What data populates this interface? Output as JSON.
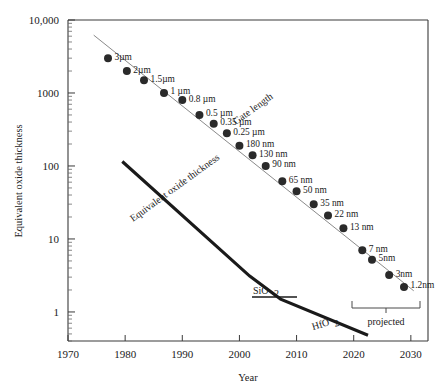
{
  "chart_data": {
    "type": "scatter",
    "title": "",
    "xlabel": "Year",
    "ylabel": "Equivalent oxide thickness",
    "xlim": [
      1970,
      2033
    ],
    "ylim": [
      0.4,
      10000
    ],
    "yscale": "log",
    "xscale": "linear",
    "grid": false,
    "legend": "none",
    "xticks": [
      1970,
      1980,
      1990,
      2000,
      2010,
      2020,
      2030
    ],
    "xticklabels": [
      "1970",
      "1980",
      "1990",
      "2000",
      "2010",
      "2020",
      "2030"
    ],
    "yticks": [
      1,
      10,
      100,
      1000,
      10000
    ],
    "yticklabels": [
      "1",
      "10",
      "100",
      "1000",
      "10,000"
    ],
    "series": [
      {
        "name": "Gate length",
        "type": "scatter",
        "annotation": "Gate length",
        "points": [
          {
            "label": "3µm",
            "x": 1977.0,
            "y": 3000
          },
          {
            "label": "2µm",
            "x": 1980.3,
            "y": 2000
          },
          {
            "label": "1.5µm",
            "x": 1983.3,
            "y": 1500
          },
          {
            "label": "1 µm",
            "x": 1986.8,
            "y": 1000
          },
          {
            "label": "0.8 µm",
            "x": 1990.0,
            "y": 800
          },
          {
            "label": "0.5 µm",
            "x": 1993.0,
            "y": 500
          },
          {
            "label": "0.35 µm",
            "x": 1995.5,
            "y": 380
          },
          {
            "label": "0.25 µm",
            "x": 1997.8,
            "y": 280
          },
          {
            "label": "180 nm",
            "x": 2000.0,
            "y": 190
          },
          {
            "label": "130 nm",
            "x": 2002.3,
            "y": 140
          },
          {
            "label": "90 nm",
            "x": 2004.6,
            "y": 100
          },
          {
            "label": "65 nm",
            "x": 2007.5,
            "y": 62
          },
          {
            "label": "50 nm",
            "x": 2010.0,
            "y": 45
          },
          {
            "label": "35 nm",
            "x": 2013.0,
            "y": 30
          },
          {
            "label": "22 nm",
            "x": 2015.5,
            "y": 21
          },
          {
            "label": "13 nm",
            "x": 2018.2,
            "y": 14
          },
          {
            "label": "7 nm",
            "x": 2021.5,
            "y": 7
          },
          {
            "label": "5nm",
            "x": 2023.2,
            "y": 5.2
          },
          {
            "label": "3nm",
            "x": 2026.2,
            "y": 3.2
          },
          {
            "label": "1.2nm",
            "x": 2028.8,
            "y": 2.2
          }
        ],
        "fit_line": {
          "x0": 1974.5,
          "y0": 6200,
          "x1": 2030.5,
          "y1": 1.95
        }
      },
      {
        "name": "Equivalent oxide thickness",
        "type": "line",
        "annotation": "Equivalent oxide thickness",
        "materials": [
          "SiO2",
          "HfO2"
        ],
        "vertices": [
          {
            "x": 1979.5,
            "y": 115
          },
          {
            "x": 2001.8,
            "y": 3.1
          },
          {
            "x": 2007.2,
            "y": 1.5
          },
          {
            "x": 2022.5,
            "y": 0.48
          }
        ]
      }
    ],
    "annotations": [
      {
        "name": "gate-length-label",
        "text": "Gate length"
      },
      {
        "name": "eot-curve-label",
        "text": "Equivalent oxide thickness"
      },
      {
        "name": "sio2-label",
        "text": "SiO",
        "sub": "2"
      },
      {
        "name": "hfo2-label",
        "text": "HfO",
        "sub": "2"
      },
      {
        "name": "projected-label",
        "text": "projected"
      }
    ],
    "projected_bracket": {
      "label": "projected",
      "x_start": 2026.0,
      "x_end": 2032.0
    }
  },
  "axes": {
    "y_label": "Equivalent oxide thickness",
    "x_label": "Year",
    "y_ticks": [
      "10,000",
      "1000",
      "100",
      "10",
      "1"
    ],
    "x_ticks": [
      "1970",
      "1980",
      "1990",
      "2000",
      "2010",
      "2020",
      "2030"
    ]
  },
  "labels": {
    "gate_length": "Gate length",
    "eot_curve": "Equivalent oxide thickness",
    "sio2_main": "SiO",
    "sio2_sub": "2",
    "hfo2_main": "HfO",
    "hfo2_sub": "2",
    "projected": "projected"
  },
  "points": [
    "3µm",
    "2µm",
    "1.5µm",
    "1 µm",
    "0.8 µm",
    "0.5 µm",
    "0.35 µm",
    "0.25 µm",
    "180 nm",
    "130 nm",
    "90 nm",
    "65 nm",
    "50 nm",
    "35 nm",
    "22 nm",
    "13 nm",
    "7 nm",
    "5nm",
    "3nm",
    "1.2nm"
  ],
  "colors": {
    "axis": "#3a3a3a",
    "dot": "#2a2a2a",
    "trend": "#8a8a8a",
    "eot": "#1a1a1a",
    "background": "#ffffff"
  }
}
